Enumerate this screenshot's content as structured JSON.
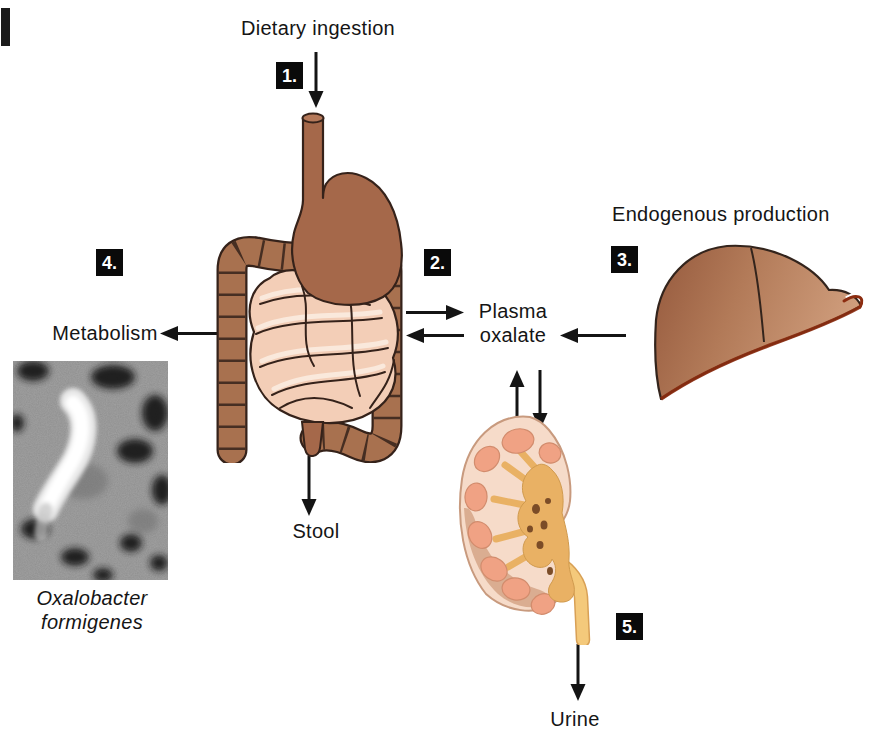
{
  "figure": {
    "labels": {
      "dietary_ingestion": "Dietary ingestion",
      "endogenous_production": "Endogenous production",
      "plasma_oxalate": [
        "Plasma",
        "oxalate"
      ],
      "metabolism": "Metabolism",
      "stool": "Stool",
      "urine": "Urine",
      "organism": [
        "Oxalobacter",
        "formigenes"
      ]
    },
    "steps": [
      "1.",
      "2.",
      "3.",
      "4.",
      "5."
    ],
    "edges": [
      {
        "step": "1.",
        "from": "Dietary ingestion",
        "to": "GI tract",
        "direction": "one-way"
      },
      {
        "step": "2.",
        "from": "GI tract",
        "to": "Plasma oxalate",
        "direction": "two-way"
      },
      {
        "step": "3.",
        "from": "Liver (Endogenous production)",
        "to": "Plasma oxalate",
        "direction": "one-way"
      },
      {
        "step": "4.",
        "from": "GI tract",
        "to": "Metabolism (Oxalobacter formigenes)",
        "direction": "one-way"
      },
      {
        "from": "GI tract",
        "to": "Stool",
        "direction": "one-way"
      },
      {
        "from": "Plasma oxalate",
        "to": "Kidney",
        "direction": "two-way"
      },
      {
        "step": "5.",
        "from": "Kidney",
        "to": "Urine",
        "direction": "one-way"
      }
    ],
    "illustrations": [
      {
        "name": "gi-tract",
        "description": "Stomach and intestines"
      },
      {
        "name": "liver",
        "description": "Liver"
      },
      {
        "name": "kidney",
        "description": "Kidney cross-section with ureter"
      },
      {
        "name": "oxalobacter-micrograph",
        "description": "Electron micrograph of Oxalobacter formigenes"
      }
    ],
    "colors": {
      "background": "#ffffff",
      "text": "#151515",
      "step_badge_bg": "#0a0a0a",
      "step_badge_text": "#ffffff",
      "arrow": "#141414",
      "stomach_brown": "#a5684a",
      "colon_brown": "#a8714f",
      "small_intestine_pink": "#f3ceb7",
      "liver_dark": "#95593d",
      "liver_light": "#cf9d7c",
      "liver_rim_red": "#8c2c10",
      "kidney_cortex": "#f6dbc9",
      "kidney_pyramid": "#f0a284",
      "kidney_pelvis": "#e9b164",
      "ureter_yellow": "#f4c97b",
      "micrograph_gray": "#8f8f8f"
    }
  }
}
